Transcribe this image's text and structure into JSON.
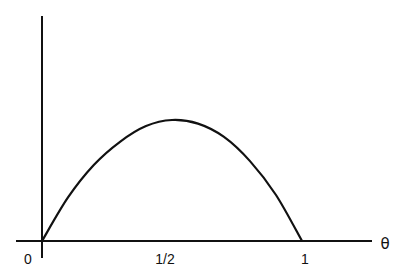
{
  "chart_data": {
    "type": "line",
    "title": "",
    "xlabel": "θ",
    "ylabel": "",
    "x_ticks": [
      {
        "value": 0,
        "label": "0"
      },
      {
        "value": 0.5,
        "label": "1/2"
      },
      {
        "value": 1,
        "label": "1"
      }
    ],
    "xlim": [
      0,
      1
    ],
    "ylim": [
      0,
      1
    ],
    "grid": false,
    "legend": null,
    "series": [
      {
        "name": "curve",
        "x": [
          0,
          0.1,
          0.2,
          0.3,
          0.4,
          0.5,
          0.6,
          0.7,
          0.8,
          0.9,
          1.0
        ],
        "y": [
          0,
          0.36,
          0.63,
          0.82,
          0.95,
          1.0,
          0.97,
          0.86,
          0.66,
          0.38,
          0
        ]
      }
    ]
  },
  "labels": {
    "origin": "0",
    "half": "1/2",
    "one": "1",
    "axis_x": "θ"
  },
  "colors": {
    "line": "#111111",
    "background": "#ffffff"
  }
}
